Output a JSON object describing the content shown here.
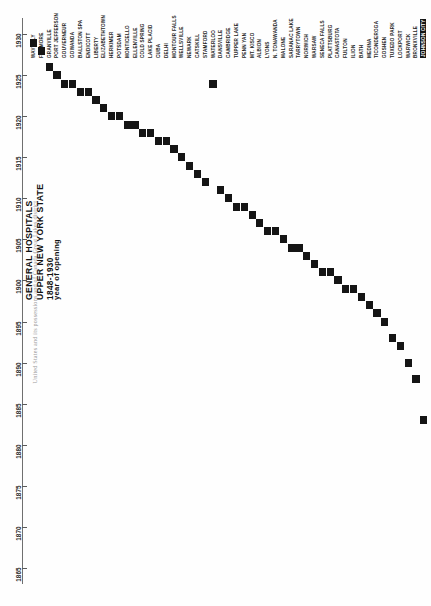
{
  "page_header": "United States and its possessions and of Canada  Great Lakes district",
  "title": {
    "line1": "GENERAL HOSPITALS",
    "line2": "UPPER NEW YORK STATE",
    "line3": "1848-1930"
  },
  "axis_label": "year of opening",
  "chart_data": {
    "type": "bar",
    "title": "GENERAL HOSPITALS UPPER NEW YORK STATE 1848-1930",
    "xlabel": "",
    "ylabel": "year of opening",
    "ylim": [
      1863,
      1932
    ],
    "grid": false,
    "legend": null,
    "orientation": "vertical-time-axis",
    "note": "Each column is a city; the black mark shows that city's hospital opening year. Cities are sorted by opening year, producing a descending staircase.",
    "tick_labels": [
      1865,
      1870,
      1875,
      1880,
      1885,
      1890,
      1895,
      1900,
      1905,
      1910,
      1915,
      1920,
      1925,
      1930
    ],
    "categories": [
      "WAVERLY",
      "FILLMORE",
      "GRANVILLE",
      "PORT JEFFERSON",
      "GOUVERNEUR",
      "GOWANDA",
      "BALLSTON SPA",
      "ENDICOTT",
      "LIBERTY",
      "ELIZABETHTOWN",
      "HERKIMER",
      "POTSDAM",
      "MONTICELLO",
      "ELLENVILLE",
      "COLD SPRING",
      "LAKE PLACID",
      "CUBA",
      "DELHI",
      "MONTOUR FALLS",
      "WELLSVILLE",
      "NEWARK",
      "CATSKILL",
      "STAMFORD",
      "WATERLOO",
      "DANSVILLE",
      "CAMBRIDGE",
      "TUPPER LAKE",
      "PENN YAN",
      "MT. KISCO",
      "ALBION",
      "LYONS",
      "N. TONAWANDA",
      "MALONE",
      "SARANAC LAKE",
      "TARRYTOWN",
      "NORWICH",
      "WARSAW",
      "SENECA FALLS",
      "PLATTSBURG",
      "CANASTOTA",
      "FULTON",
      "ILION",
      "BATH",
      "MEDINA",
      "TICONDEROGA",
      "GOSHEN",
      "TUXEDO PARK",
      "LOCKPORT",
      "WARWICK",
      "BRONXVILLE",
      "JOHNSON CITY"
    ],
    "values": [
      1929,
      1928,
      1926,
      1925,
      1924,
      1924,
      1923,
      1923,
      1922,
      1921,
      1920,
      1920,
      1919,
      1919,
      1918,
      1918,
      1917,
      1917,
      1916,
      1915,
      1914,
      1913,
      1912,
      1924,
      1911,
      1910,
      1909,
      1909,
      1908,
      1907,
      1906,
      1906,
      1905,
      1904,
      1904,
      1903,
      1902,
      1901,
      1901,
      1900,
      1899,
      1899,
      1898,
      1897,
      1896,
      1895,
      1893,
      1892,
      1890,
      1888,
      1883
    ]
  }
}
